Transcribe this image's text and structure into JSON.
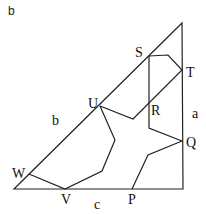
{
  "caption": "b",
  "triangle": {
    "points": [
      [
        14,
        189
      ],
      [
        183,
        189
      ],
      [
        182,
        23
      ]
    ],
    "side_labels": {
      "a": "a",
      "b": "b",
      "c": "c"
    }
  },
  "vertices": {
    "S": "S",
    "T": "T",
    "U": "U",
    "R": "R",
    "Q": "Q",
    "W": "W",
    "V": "V",
    "P": "P"
  },
  "polylines": {
    "s_shape": [
      [
        149,
        56
      ],
      [
        168,
        55
      ],
      [
        182,
        70
      ],
      [
        133,
        119
      ],
      [
        100,
        106
      ]
    ],
    "r_segment": [
      [
        149,
        56
      ],
      [
        149,
        128
      ],
      [
        182,
        141
      ]
    ],
    "u_v_path": [
      [
        100,
        106
      ],
      [
        115,
        140
      ],
      [
        102,
        171
      ],
      [
        65,
        189
      ],
      [
        29,
        174
      ]
    ],
    "p_q_path": [
      [
        132,
        189
      ],
      [
        148,
        155
      ],
      [
        182,
        141
      ]
    ]
  },
  "colors": {
    "line": "#222222",
    "background": "#ffffff"
  }
}
